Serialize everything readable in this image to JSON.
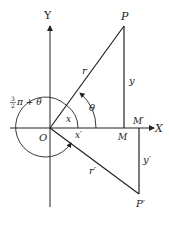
{
  "diagram": {
    "axes": {
      "x_label": "X",
      "y_label": "Y"
    },
    "points": {
      "origin": "O",
      "P": "P",
      "P_prime": "P′",
      "M": "M",
      "M_prime": "M′"
    },
    "segments": {
      "r": "r",
      "r_prime": "r′",
      "y": "y",
      "y_prime": "y′",
      "x": "x",
      "x_prime": "x′"
    },
    "angles": {
      "theta": "θ",
      "rotation_fraction_num": "3",
      "rotation_fraction_den": "2",
      "rotation_rest": "π + θ"
    },
    "colors": {
      "line": "#222222",
      "background": "#ffffff"
    }
  }
}
